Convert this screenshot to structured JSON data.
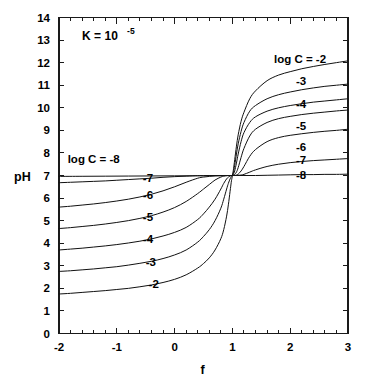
{
  "chart_data": {
    "type": "line",
    "title": "",
    "xlabel": "f",
    "ylabel": "pH",
    "xlim": [
      -2,
      3
    ],
    "ylim": [
      0,
      14
    ],
    "grid": false,
    "legend_position": "inline-curve-labels",
    "annotations": [
      {
        "name": "equilibrium-constant",
        "text_main": "K = 10",
        "text_sup": "-5",
        "x": -1.6,
        "y": 13.0
      }
    ],
    "x_ticks": [
      -2,
      -1,
      0,
      1,
      2,
      3
    ],
    "x_tick_labels": [
      "-2",
      "-1",
      "0",
      "1",
      "2",
      "3"
    ],
    "x_minor_ticks_per_interval": 5,
    "y_ticks": [
      0,
      1,
      2,
      3,
      4,
      5,
      6,
      7,
      8,
      9,
      10,
      11,
      12,
      13,
      14
    ],
    "y_tick_labels": [
      "0",
      "1",
      "2",
      "3",
      "4",
      "5",
      "6",
      "7",
      "8",
      "9",
      "10",
      "11",
      "12",
      "13",
      "14"
    ],
    "series": [
      {
        "name": "log C = -2",
        "label": "log C = -2",
        "label_prefix": "log C = ",
        "label_value": "-2",
        "left_label": "-2",
        "right_label": "-2",
        "left_label_x": -0.45,
        "left_label_y": 2.0,
        "right_label_x": 1.72,
        "right_label_y": 12.0,
        "log_c": -2,
        "x": [
          -2.0,
          -1.8,
          -1.6,
          -1.4,
          -1.2,
          -1.0,
          -0.8,
          -0.6,
          -0.4,
          -0.2,
          0.0,
          0.2,
          0.4,
          0.5,
          0.6,
          0.7,
          0.8,
          0.85,
          0.9,
          0.93,
          0.96,
          0.98,
          0.99,
          1.0,
          1.01,
          1.02,
          1.04,
          1.07,
          1.1,
          1.15,
          1.2,
          1.3,
          1.4,
          1.6,
          1.8,
          2.0,
          2.2,
          2.4,
          2.6,
          2.8,
          3.0
        ],
        "y": [
          1.75,
          1.78,
          1.82,
          1.86,
          1.9,
          1.95,
          2.0,
          2.07,
          2.15,
          2.26,
          2.4,
          2.6,
          2.9,
          3.1,
          3.35,
          3.7,
          4.2,
          4.6,
          5.2,
          5.7,
          6.3,
          6.7,
          6.85,
          7.0,
          7.15,
          7.3,
          7.7,
          8.3,
          8.8,
          9.4,
          9.8,
          10.4,
          10.75,
          11.2,
          11.45,
          11.6,
          11.73,
          11.83,
          11.92,
          12.0,
          12.08
        ]
      },
      {
        "name": "log C = -3",
        "label": "log C = -3",
        "label_prefix": "",
        "label_value": "-3",
        "left_label": "-3",
        "right_label": "-3",
        "left_label_x": -0.5,
        "left_label_y": 3.0,
        "right_label_x": 2.1,
        "right_label_y": 11.0,
        "log_c": -3,
        "x": [
          -2.0,
          -1.8,
          -1.6,
          -1.4,
          -1.2,
          -1.0,
          -0.8,
          -0.6,
          -0.4,
          -0.2,
          0.0,
          0.2,
          0.4,
          0.5,
          0.6,
          0.7,
          0.8,
          0.85,
          0.9,
          0.93,
          0.96,
          0.98,
          0.99,
          1.0,
          1.01,
          1.02,
          1.04,
          1.07,
          1.1,
          1.15,
          1.2,
          1.3,
          1.4,
          1.6,
          1.8,
          2.0,
          2.2,
          2.4,
          2.6,
          2.8,
          3.0
        ],
        "y": [
          2.75,
          2.78,
          2.82,
          2.86,
          2.91,
          2.96,
          3.03,
          3.11,
          3.2,
          3.32,
          3.48,
          3.7,
          4.05,
          4.3,
          4.6,
          5.0,
          5.55,
          5.95,
          6.4,
          6.65,
          6.85,
          6.95,
          7.0,
          7.0,
          7.05,
          7.15,
          7.45,
          7.95,
          8.4,
          8.95,
          9.35,
          9.85,
          10.1,
          10.4,
          10.58,
          10.7,
          10.8,
          10.88,
          10.95,
          11.0,
          11.05
        ]
      },
      {
        "name": "log C = -4",
        "label": "log C = -4",
        "label_prefix": "",
        "label_value": "-4",
        "left_label": "-4",
        "right_label": "-4",
        "left_label_x": -0.55,
        "left_label_y": 4.0,
        "right_label_x": 2.1,
        "right_label_y": 10.0,
        "log_c": -4,
        "x": [
          -2.0,
          -1.8,
          -1.6,
          -1.4,
          -1.2,
          -1.0,
          -0.8,
          -0.6,
          -0.4,
          -0.2,
          0.0,
          0.2,
          0.4,
          0.5,
          0.6,
          0.7,
          0.8,
          0.85,
          0.9,
          0.93,
          0.96,
          0.98,
          0.99,
          1.0,
          1.01,
          1.02,
          1.04,
          1.07,
          1.1,
          1.15,
          1.2,
          1.3,
          1.4,
          1.6,
          1.8,
          2.0,
          2.2,
          2.4,
          2.6,
          2.8,
          3.0
        ],
        "y": [
          3.7,
          3.74,
          3.78,
          3.83,
          3.88,
          3.94,
          4.01,
          4.09,
          4.19,
          4.32,
          4.48,
          4.7,
          5.05,
          5.3,
          5.6,
          5.95,
          6.4,
          6.65,
          6.85,
          6.93,
          6.98,
          7.0,
          7.0,
          7.0,
          7.02,
          7.07,
          7.2,
          7.55,
          7.95,
          8.5,
          8.9,
          9.35,
          9.6,
          9.85,
          10.0,
          10.1,
          10.18,
          10.25,
          10.3,
          10.35,
          10.4
        ]
      },
      {
        "name": "log C = -5",
        "label": "log C = -5",
        "label_prefix": "",
        "label_value": "-5",
        "left_label": "-5",
        "right_label": "-5",
        "left_label_x": -0.55,
        "left_label_y": 5.0,
        "right_label_x": 2.1,
        "right_label_y": 9.0,
        "log_c": -5,
        "x": [
          -2.0,
          -1.8,
          -1.6,
          -1.4,
          -1.2,
          -1.0,
          -0.8,
          -0.6,
          -0.4,
          -0.2,
          0.0,
          0.2,
          0.4,
          0.5,
          0.6,
          0.7,
          0.8,
          0.85,
          0.9,
          0.93,
          0.96,
          0.98,
          0.99,
          1.0,
          1.01,
          1.02,
          1.04,
          1.07,
          1.1,
          1.15,
          1.2,
          1.3,
          1.4,
          1.6,
          1.8,
          2.0,
          2.2,
          2.4,
          2.6,
          2.8,
          3.0
        ],
        "y": [
          4.65,
          4.69,
          4.74,
          4.79,
          4.85,
          4.92,
          5.0,
          5.1,
          5.22,
          5.38,
          5.58,
          5.85,
          6.2,
          6.4,
          6.6,
          6.8,
          6.93,
          6.97,
          6.99,
          7.0,
          7.0,
          7.0,
          7.0,
          7.0,
          7.0,
          7.01,
          7.05,
          7.15,
          7.35,
          7.8,
          8.2,
          8.75,
          9.05,
          9.35,
          9.52,
          9.62,
          9.7,
          9.76,
          9.81,
          9.86,
          9.9
        ]
      },
      {
        "name": "log C = -6",
        "label": "log C = -6",
        "label_prefix": "",
        "label_value": "-6",
        "left_label": "-6",
        "right_label": "-6",
        "left_label_x": -0.55,
        "left_label_y": 5.95,
        "right_label_x": 2.1,
        "right_label_y": 8.1,
        "log_c": -6,
        "x": [
          -2.0,
          -1.8,
          -1.6,
          -1.4,
          -1.2,
          -1.0,
          -0.8,
          -0.6,
          -0.4,
          -0.2,
          0.0,
          0.2,
          0.4,
          0.5,
          0.6,
          0.7,
          0.8,
          0.85,
          0.9,
          0.93,
          0.96,
          0.98,
          0.99,
          1.0,
          1.01,
          1.02,
          1.04,
          1.07,
          1.1,
          1.15,
          1.2,
          1.3,
          1.4,
          1.6,
          1.8,
          2.0,
          2.2,
          2.4,
          2.6,
          2.8,
          3.0
        ],
        "y": [
          5.6,
          5.64,
          5.69,
          5.74,
          5.8,
          5.87,
          5.95,
          6.05,
          6.17,
          6.32,
          6.5,
          6.7,
          6.88,
          6.93,
          6.96,
          6.98,
          6.99,
          7.0,
          7.0,
          7.0,
          7.0,
          7.0,
          7.0,
          7.0,
          7.0,
          7.0,
          7.0,
          7.02,
          7.06,
          7.2,
          7.4,
          7.85,
          8.15,
          8.5,
          8.68,
          8.78,
          8.85,
          8.91,
          8.96,
          9.0,
          9.05
        ]
      },
      {
        "name": "log C = -7",
        "label": "log C = -7",
        "label_prefix": "",
        "label_value": "-7",
        "left_label": "-7",
        "right_label": "-7",
        "left_label_x": -0.55,
        "left_label_y": 6.7,
        "right_label_x": 2.1,
        "right_label_y": 7.5,
        "log_c": -7,
        "x": [
          -2.0,
          -1.8,
          -1.6,
          -1.4,
          -1.2,
          -1.0,
          -0.8,
          -0.6,
          -0.4,
          -0.2,
          0.0,
          0.2,
          0.4,
          0.5,
          0.6,
          0.7,
          0.8,
          0.85,
          0.9,
          0.93,
          0.96,
          0.98,
          0.99,
          1.0,
          1.01,
          1.02,
          1.04,
          1.07,
          1.1,
          1.15,
          1.2,
          1.3,
          1.4,
          1.6,
          1.8,
          2.0,
          2.2,
          2.4,
          2.6,
          2.8,
          3.0
        ],
        "y": [
          6.68,
          6.7,
          6.72,
          6.74,
          6.76,
          6.79,
          6.82,
          6.85,
          6.88,
          6.92,
          6.95,
          6.97,
          6.99,
          6.99,
          7.0,
          7.0,
          7.0,
          7.0,
          7.0,
          7.0,
          7.0,
          7.0,
          7.0,
          7.0,
          7.0,
          7.0,
          7.0,
          7.0,
          7.01,
          7.02,
          7.05,
          7.15,
          7.25,
          7.4,
          7.5,
          7.57,
          7.62,
          7.66,
          7.69,
          7.72,
          7.75
        ]
      },
      {
        "name": "log C = -8",
        "label": "log C = -8",
        "label_prefix": "log C = ",
        "label_value": "-8",
        "left_label": "log C = -8",
        "right_label": "-8",
        "left_label_x": -1.85,
        "left_label_y": 7.55,
        "right_label_x": 2.1,
        "right_label_y": 6.85,
        "log_c": -8,
        "x": [
          -2.0,
          -1.6,
          -1.2,
          -0.8,
          -0.4,
          0.0,
          0.4,
          0.8,
          1.0,
          1.2,
          1.4,
          1.6,
          1.8,
          2.0,
          2.2,
          2.4,
          2.6,
          2.8,
          3.0
        ],
        "y": [
          6.96,
          6.965,
          6.97,
          6.975,
          6.98,
          6.985,
          6.99,
          6.995,
          7.0,
          7.0,
          7.0,
          7.01,
          7.02,
          7.03,
          7.04,
          7.04,
          7.05,
          7.05,
          7.06
        ]
      }
    ]
  },
  "axis": {
    "x_title": "f",
    "y_title": "pH"
  }
}
